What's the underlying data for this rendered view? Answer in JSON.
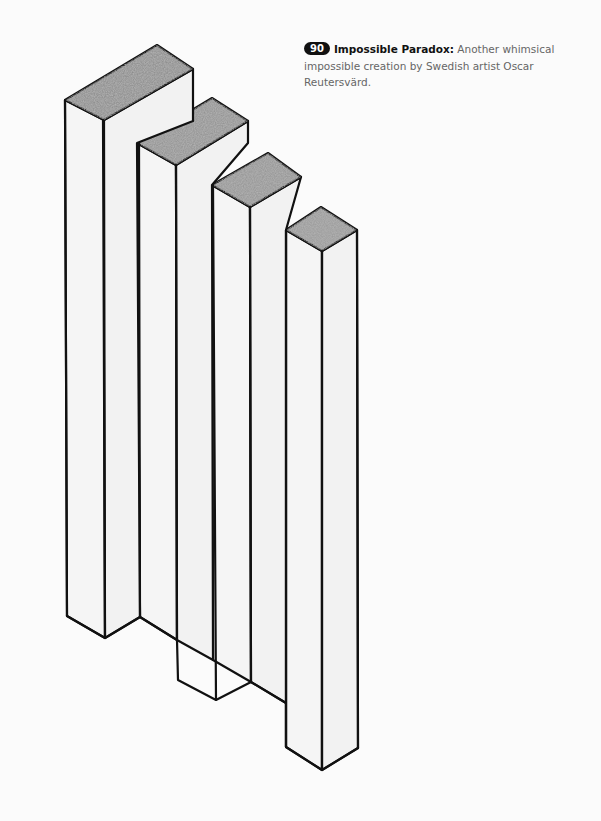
{
  "caption": {
    "number": "90",
    "title": "Impossible Paradox:",
    "text": "Another whimsical impossible creation by Swedish artist Oscar Reutersvärd."
  },
  "illustration": {
    "description": "Four isometric rectangular columns of decreasing height forming an impossible figure",
    "top_face_color": "#8f8f8f",
    "side_face_color": "#f4f4f4",
    "outline_color": "#111111"
  }
}
